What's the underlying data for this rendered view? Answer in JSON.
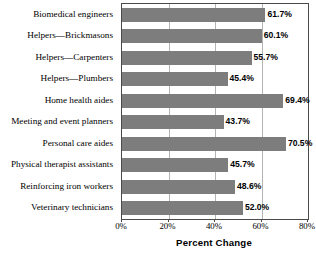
{
  "chart_data": {
    "type": "bar",
    "orientation": "horizontal",
    "title": "",
    "xlabel": "Percent Change",
    "ylabel": "",
    "xlim": [
      0,
      80
    ],
    "xticks": [
      "0%",
      "20%",
      "40%",
      "60%",
      "80%"
    ],
    "xtick_values": [
      0,
      20,
      40,
      60,
      80
    ],
    "grid": true,
    "legend": null,
    "bar_color": "#7d7d7d",
    "categories": [
      "Biomedical engineers",
      "Helpers—Brickmasons",
      "Helpers—Carpenters",
      "Helpers—Plumbers",
      "Home health aides",
      "Meeting and event planners",
      "Personal care aides",
      "Physical therapist assistants",
      "Reinforcing iron workers",
      "Veterinary technicians"
    ],
    "values": [
      61.7,
      60.1,
      55.7,
      45.4,
      69.4,
      43.7,
      70.5,
      45.7,
      48.6,
      52.0
    ],
    "data_labels": [
      "61.7%",
      "60.1%",
      "55.7%",
      "45.4%",
      "69.4%",
      "43.7%",
      "70.5%",
      "45.7%",
      "48.6%",
      "52.0%"
    ]
  }
}
